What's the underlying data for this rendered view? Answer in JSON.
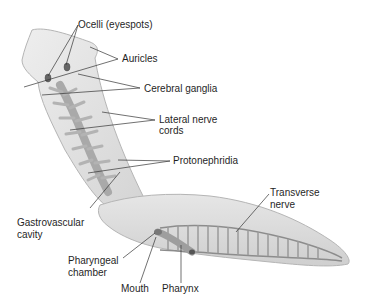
{
  "diagram": {
    "labels": {
      "ocelli": "Ocelli (eyespots)",
      "auricles": "Auricles",
      "cerebral_ganglia": "Cerebral ganglia",
      "lateral_nerve_cords_1": "Lateral nerve",
      "lateral_nerve_cords_2": "cords",
      "protonephridia": "Protonephridia",
      "transverse_nerve_1": "Transverse",
      "transverse_nerve_2": "nerve",
      "gastrovascular_cavity_1": "Gastrovascular",
      "gastrovascular_cavity_2": "cavity",
      "pharyngeal_chamber_1": "Pharyngeal",
      "pharyngeal_chamber_2": "chamber",
      "mouth": "Mouth",
      "pharynx": "Pharynx"
    },
    "colors": {
      "body_fill": "#e4e4e4",
      "body_edge": "#b5b5b5",
      "gut": "#a9a9a9",
      "nerve": "#8c8c8c",
      "leader_line": "#333333",
      "text": "#1f1f1f"
    }
  }
}
